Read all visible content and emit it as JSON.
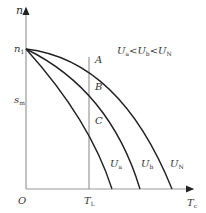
{
  "diagram": {
    "type": "motor-mechanical-characteristic",
    "axes": {
      "y_label": "n",
      "x_label": "T",
      "x_label_sub": "c",
      "origin_label": "O"
    },
    "y_ticks": [
      {
        "label": "n",
        "sub": "1"
      },
      {
        "label": "s",
        "sub": "m"
      }
    ],
    "x_ticks": [
      {
        "label": "T",
        "sub": "L"
      }
    ],
    "points": [
      {
        "label": "A"
      },
      {
        "label": "B"
      },
      {
        "label": "C"
      }
    ],
    "curves": [
      {
        "label": "U",
        "sub": "a"
      },
      {
        "label": "U",
        "sub": "b"
      },
      {
        "label": "U",
        "sub": "N"
      }
    ],
    "relation": {
      "parts": [
        {
          "label": "U",
          "sub": "a"
        },
        {
          "op": "<"
        },
        {
          "label": "U",
          "sub": "b"
        },
        {
          "op": "<"
        },
        {
          "label": "U",
          "sub": "N"
        }
      ]
    },
    "colors": {
      "curve": "#222222",
      "axis": "#888888",
      "text": "#333333"
    }
  }
}
